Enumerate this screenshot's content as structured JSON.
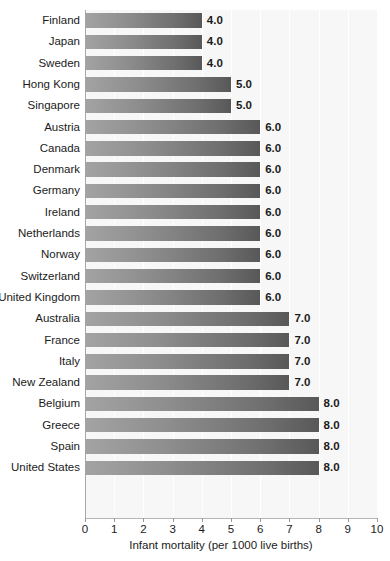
{
  "chart_data": {
    "type": "bar",
    "orientation": "horizontal",
    "title": "",
    "xlabel": "Infant mortality (per 1000 live births)",
    "ylabel": "",
    "xlim": [
      0,
      10
    ],
    "xticks": [
      0,
      1,
      2,
      3,
      4,
      5,
      6,
      7,
      8,
      9,
      10
    ],
    "xtick_labels": [
      "0",
      "1",
      "2",
      "3",
      "4",
      "5",
      "6",
      "7",
      "8",
      "9",
      "10"
    ],
    "grid": "vertical",
    "legend": "none",
    "bar_gradient": [
      "#a3a3a3",
      "#585858"
    ],
    "plot_background": "#f7f7f7",
    "categories": [
      "Finland",
      "Japan",
      "Sweden",
      "Hong Kong",
      "Singapore",
      "Austria",
      "Canada",
      "Denmark",
      "Germany",
      "Ireland",
      "Netherlands",
      "Norway",
      "Switzerland",
      "United Kingdom",
      "Australia",
      "France",
      "Italy",
      "New Zealand",
      "Belgium",
      "Greece",
      "Spain",
      "United States"
    ],
    "values": [
      4.0,
      4.0,
      4.0,
      5.0,
      5.0,
      6.0,
      6.0,
      6.0,
      6.0,
      6.0,
      6.0,
      6.0,
      6.0,
      6.0,
      7.0,
      7.0,
      7.0,
      7.0,
      8.0,
      8.0,
      8.0,
      8.0
    ],
    "value_labels": [
      "4.0",
      "4.0",
      "4.0",
      "5.0",
      "5.0",
      "6.0",
      "6.0",
      "6.0",
      "6.0",
      "6.0",
      "6.0",
      "6.0",
      "6.0",
      "6.0",
      "7.0",
      "7.0",
      "7.0",
      "7.0",
      "8.0",
      "8.0",
      "8.0",
      "8.0"
    ]
  }
}
